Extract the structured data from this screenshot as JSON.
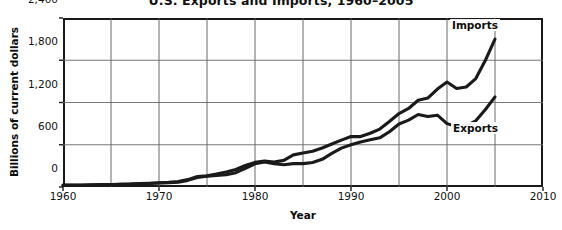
{
  "chart_data": {
    "type": "line",
    "title": "U.S. Exports and Imports, 1960–2005",
    "xlabel": "Year",
    "ylabel": "Billions of current dollars",
    "xlim": [
      1960,
      2010
    ],
    "ylim": [
      0,
      2400
    ],
    "yticks": [
      "0",
      "600",
      "1,200",
      "1,800",
      "2,400"
    ],
    "ytick_values": [
      0,
      600,
      1200,
      1800,
      2400
    ],
    "xticks": [
      "1960",
      "1970",
      "1980",
      "1990",
      "2000",
      "2010"
    ],
    "xtick_values": [
      1960,
      1970,
      1980,
      1990,
      2000,
      2010
    ],
    "grid": "major gridlines every 5 years on x, every 600 on y",
    "legend": "inline series labels inside plot area",
    "x": [
      1960,
      1961,
      1962,
      1963,
      1964,
      1965,
      1966,
      1967,
      1968,
      1969,
      1970,
      1971,
      1972,
      1973,
      1974,
      1975,
      1976,
      1977,
      1978,
      1979,
      1980,
      1981,
      1982,
      1983,
      1984,
      1985,
      1986,
      1987,
      1988,
      1989,
      1990,
      1991,
      1992,
      1993,
      1994,
      1995,
      1996,
      1997,
      1998,
      1999,
      2000,
      2001,
      2002,
      2003,
      2004,
      2005
    ],
    "series": [
      {
        "name": "Imports",
        "color": "#1a1a1a",
        "values": [
          23,
          23,
          25,
          26,
          29,
          32,
          38,
          41,
          49,
          54,
          60,
          66,
          79,
          105,
          148,
          158,
          186,
          214,
          248,
          305,
          350,
          368,
          356,
          378,
          456,
          484,
          509,
          554,
          610,
          666,
          717,
          716,
          763,
          823,
          930,
          1043,
          1115,
          1232,
          1263,
          1390,
          1490,
          1400,
          1420,
          1540,
          1800,
          2100
        ]
      },
      {
        "name": "Exports",
        "color": "#1a1a1a",
        "values": [
          26,
          27,
          28,
          30,
          34,
          36,
          40,
          42,
          46,
          50,
          57,
          60,
          68,
          94,
          135,
          153,
          165,
          174,
          203,
          265,
          330,
          355,
          330,
          315,
          332,
          332,
          348,
          393,
          477,
          552,
          600,
          640,
          670,
          698,
          785,
          895,
          950,
          1030,
          1000,
          1020,
          900,
          860,
          870,
          940,
          1100,
          1280
        ]
      }
    ],
    "annotations": [
      {
        "text": "Imports",
        "near_year": 2001,
        "near_value": 2330
      },
      {
        "text": "Exports",
        "near_year": 2001,
        "near_value": 870
      }
    ]
  }
}
